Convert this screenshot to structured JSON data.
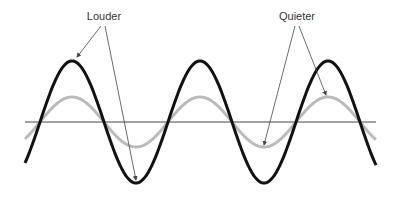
{
  "diagram": {
    "labels": {
      "louder": "Louder",
      "quieter": "Quieter"
    },
    "waves": [
      {
        "name": "louder",
        "amplitude_px": 61,
        "color": "#111111",
        "stroke_width": 3
      },
      {
        "name": "quieter",
        "amplitude_px": 25,
        "color": "#bbbbbb",
        "stroke_width": 3
      }
    ],
    "period_px": 128,
    "baseline_y": 122,
    "x_start": 25,
    "x_end": 376,
    "phase_peak_x": 72,
    "axis_color": "#444444",
    "pointer_color": "#444444"
  }
}
